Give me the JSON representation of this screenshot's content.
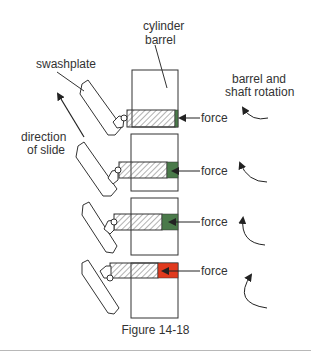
{
  "labels": {
    "cylinder_barrel_line1": "cylinder",
    "cylinder_barrel_line2": "barrel",
    "swashplate": "swashplate",
    "direction_line1": "direction",
    "direction_line2": "of slide",
    "rotation_line1": "barrel and",
    "rotation_line2": "shaft rotation",
    "force": "force"
  },
  "caption": "Figure 14-18",
  "colors": {
    "line": "#333333",
    "hatch": "#555555",
    "green_fluid": "#4a7a4a",
    "red_fluid": "#e03a1e",
    "rule": "#b8b8b8"
  },
  "stages": [
    {
      "index": 1,
      "fluid": "green",
      "force_label": "force"
    },
    {
      "index": 2,
      "fluid": "green",
      "force_label": "force"
    },
    {
      "index": 3,
      "fluid": "green",
      "force_label": "force"
    },
    {
      "index": 4,
      "fluid": "red",
      "force_label": "force"
    }
  ]
}
